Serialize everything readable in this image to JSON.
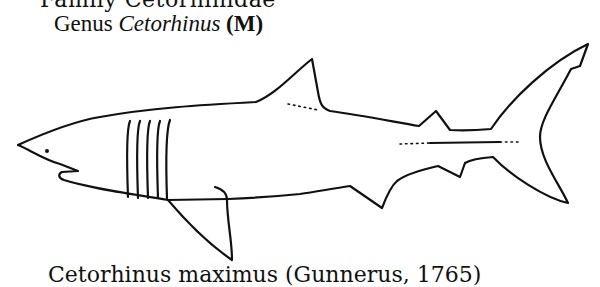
{
  "header": {
    "family_line": "Family Cetorhinidae",
    "genus_prefix": "Genus ",
    "genus_name": "Cetorhinus",
    "genus_suffix": " (M)"
  },
  "figure": {
    "gill_slit_count": 5,
    "colors": {
      "line": "#111111",
      "background": "#ffffff"
    }
  },
  "footer": {
    "species_line": "Cetorhinus maximus (Gunnerus, 1765)"
  }
}
